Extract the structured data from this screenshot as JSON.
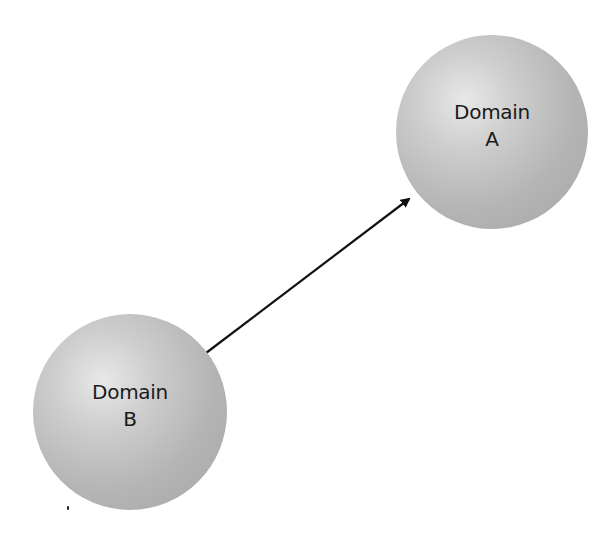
{
  "diagram": {
    "type": "node-link",
    "nodes": [
      {
        "id": "A",
        "line1": "Domain",
        "line2": "A",
        "fill": "#b8b8b8"
      },
      {
        "id": "B",
        "line1": "Domain",
        "line2": "B",
        "fill": "#b8b8b8"
      }
    ],
    "edges": [
      {
        "from": "B",
        "to": "A",
        "directed": true,
        "color": "#111111"
      }
    ]
  }
}
